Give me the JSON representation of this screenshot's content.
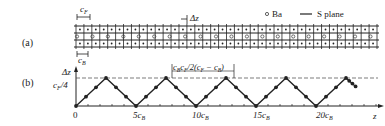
{
  "panel_a": {
    "label": "(a)",
    "legend": {
      "ba_label": "Ba",
      "s_plane_label": "S plane"
    },
    "cF_label": "c",
    "cF_sub": "F",
    "cB_label": "c",
    "cB_sub": "B",
    "dz_label": "Δz",
    "grid_x_start": 76,
    "grid_x_end": 377,
    "grid_columns": 38
  },
  "panel_b": {
    "label": "(b)",
    "y_axis_label": "Δz",
    "y_top_label": "c_B",
    "y_tick_label": "c_F/4",
    "x_axis_label": "z",
    "annotation": "c_B c_F / 2(c_F − c_B)",
    "x_tick_labels": [
      "0",
      "5c_B",
      "10c_B",
      "15c_B",
      "20c_B"
    ]
  },
  "chart_data": {
    "type": "line",
    "title": "",
    "xlabel": "z",
    "ylabel": "Δz",
    "x_ticks": [
      "0",
      "5cB",
      "10cB",
      "15cB",
      "20cB"
    ],
    "y_ticks": [
      "cF/4"
    ],
    "series": [
      {
        "name": "Δz vs z (sawtooth / triangular)",
        "x": [
          0,
          2.5,
          5.0,
          7.5,
          10.0,
          12.5,
          15.0,
          17.5,
          20.0,
          22.5,
          23.3
        ],
        "y": [
          0,
          1,
          0,
          1,
          0,
          1,
          0,
          1,
          0,
          1,
          0.7
        ]
      }
    ],
    "annotations": [
      "period cB·cF/2(cF − cB)",
      "dashed line at cF/4"
    ],
    "ylim": [
      0,
      1.0
    ],
    "xlim": [
      0,
      24
    ]
  }
}
